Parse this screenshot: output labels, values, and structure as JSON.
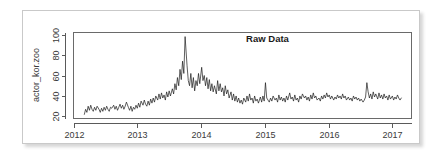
{
  "figure": {
    "frame_color": "#c9c9c9",
    "background": "#ffffff"
  },
  "chart_data": {
    "type": "line",
    "title": "Raw Data",
    "xlabel": "",
    "ylabel": "actor_kor.zoo",
    "xlim": [
      2012.0,
      2017.3
    ],
    "ylim": [
      18,
      102
    ],
    "grid": false,
    "legend": null,
    "x_tick_labels": [
      "2012",
      "2013",
      "2014",
      "2015",
      "2016",
      "2017"
    ],
    "x_tick_values": [
      2012,
      2013,
      2014,
      2015,
      2016,
      2017
    ],
    "y_tick_labels": [
      "20",
      "40",
      "60",
      "80",
      "100"
    ],
    "y_tick_values": [
      20,
      40,
      60,
      80,
      100
    ],
    "series_name": "actor_kor.zoo",
    "line_color": "#1a1a1a",
    "x": [
      2012.17,
      2012.19,
      2012.21,
      2012.23,
      2012.25,
      2012.27,
      2012.29,
      2012.31,
      2012.33,
      2012.35,
      2012.37,
      2012.4,
      2012.42,
      2012.44,
      2012.46,
      2012.48,
      2012.5,
      2012.52,
      2012.54,
      2012.56,
      2012.58,
      2012.6,
      2012.63,
      2012.65,
      2012.67,
      2012.69,
      2012.71,
      2012.73,
      2012.75,
      2012.77,
      2012.79,
      2012.81,
      2012.83,
      2012.86,
      2012.88,
      2012.9,
      2012.92,
      2012.94,
      2012.96,
      2012.98,
      2013.0,
      2013.02,
      2013.04,
      2013.06,
      2013.09,
      2013.11,
      2013.13,
      2013.15,
      2013.17,
      2013.19,
      2013.21,
      2013.23,
      2013.25,
      2013.27,
      2013.29,
      2013.32,
      2013.34,
      2013.36,
      2013.38,
      2013.4,
      2013.42,
      2013.44,
      2013.46,
      2013.48,
      2013.5,
      2013.52,
      2013.55,
      2013.57,
      2013.59,
      2013.61,
      2013.63,
      2013.65,
      2013.67,
      2013.69,
      2013.71,
      2013.73,
      2013.75,
      2013.78,
      2013.8,
      2013.82,
      2013.84,
      2013.86,
      2013.88,
      2013.9,
      2013.92,
      2013.94,
      2013.96,
      2013.98,
      2014.01,
      2014.03,
      2014.05,
      2014.07,
      2014.09,
      2014.11,
      2014.13,
      2014.15,
      2014.17,
      2014.19,
      2014.21,
      2014.24,
      2014.26,
      2014.28,
      2014.3,
      2014.32,
      2014.34,
      2014.36,
      2014.38,
      2014.4,
      2014.42,
      2014.44,
      2014.47,
      2014.49,
      2014.51,
      2014.53,
      2014.55,
      2014.57,
      2014.59,
      2014.61,
      2014.63,
      2014.65,
      2014.67,
      2014.7,
      2014.72,
      2014.74,
      2014.76,
      2014.78,
      2014.8,
      2014.82,
      2014.84,
      2014.86,
      2014.88,
      2014.9,
      2014.93,
      2014.95,
      2014.97,
      2014.99,
      2015.01,
      2015.03,
      2015.05,
      2015.07,
      2015.09,
      2015.11,
      2015.13,
      2015.16,
      2015.18,
      2015.2,
      2015.22,
      2015.24,
      2015.26,
      2015.28,
      2015.3,
      2015.32,
      2015.34,
      2015.36,
      2015.39,
      2015.41,
      2015.43,
      2015.45,
      2015.47,
      2015.49,
      2015.51,
      2015.53,
      2015.55,
      2015.57,
      2015.59,
      2015.62,
      2015.64,
      2015.66,
      2015.68,
      2015.7,
      2015.72,
      2015.74,
      2015.76,
      2015.78,
      2015.8,
      2015.82,
      2015.85,
      2015.87,
      2015.89,
      2015.91,
      2015.93,
      2015.95,
      2015.97,
      2015.99,
      2016.01,
      2016.03,
      2016.05,
      2016.08,
      2016.1,
      2016.12,
      2016.14,
      2016.16,
      2016.18,
      2016.2,
      2016.22,
      2016.24,
      2016.26,
      2016.28,
      2016.31,
      2016.33,
      2016.35,
      2016.37,
      2016.39,
      2016.41,
      2016.43,
      2016.45,
      2016.47,
      2016.49,
      2016.51,
      2016.54,
      2016.56,
      2016.58,
      2016.6,
      2016.62,
      2016.64,
      2016.66,
      2016.68,
      2016.7,
      2016.72,
      2016.74,
      2016.77,
      2016.79,
      2016.81,
      2016.83,
      2016.85,
      2016.87,
      2016.89,
      2016.91,
      2016.93,
      2016.95,
      2016.97,
      2017.0,
      2017.02,
      2017.04,
      2017.06,
      2017.08,
      2017.1,
      2017.12,
      2017.14
    ],
    "values": [
      22,
      27,
      24,
      30,
      26,
      31,
      27,
      25,
      29,
      26,
      30,
      27,
      24,
      28,
      25,
      29,
      26,
      30,
      27,
      25,
      29,
      28,
      31,
      27,
      30,
      26,
      29,
      32,
      28,
      31,
      27,
      30,
      34,
      29,
      26,
      30,
      25,
      29,
      27,
      31,
      28,
      33,
      29,
      35,
      31,
      36,
      32,
      30,
      35,
      31,
      37,
      33,
      38,
      34,
      40,
      36,
      42,
      37,
      43,
      38,
      41,
      36,
      44,
      39,
      45,
      40,
      47,
      42,
      52,
      46,
      58,
      50,
      66,
      56,
      74,
      62,
      98,
      70,
      55,
      50,
      62,
      48,
      58,
      45,
      55,
      50,
      62,
      52,
      68,
      55,
      60,
      50,
      58,
      47,
      56,
      45,
      52,
      44,
      50,
      42,
      55,
      45,
      52,
      44,
      48,
      40,
      50,
      42,
      46,
      38,
      44,
      36,
      42,
      35,
      40,
      34,
      38,
      33,
      36,
      32,
      38,
      34,
      40,
      35,
      42,
      36,
      38,
      33,
      40,
      35,
      37,
      33,
      39,
      34,
      40,
      35,
      53,
      38,
      36,
      34,
      38,
      35,
      40,
      36,
      38,
      34,
      41,
      36,
      39,
      35,
      38,
      34,
      40,
      36,
      43,
      37,
      39,
      35,
      41,
      36,
      38,
      34,
      40,
      37,
      42,
      38,
      40,
      36,
      39,
      35,
      41,
      37,
      43,
      38,
      40,
      36,
      38,
      35,
      40,
      37,
      41,
      38,
      43,
      39,
      41,
      37,
      40,
      36,
      39,
      37,
      41,
      38,
      40,
      37,
      42,
      38,
      40,
      36,
      39,
      36,
      38,
      35,
      40,
      37,
      39,
      36,
      38,
      35,
      37,
      34,
      36,
      39,
      53,
      44,
      38,
      42,
      37,
      44,
      39,
      42,
      37,
      43,
      38,
      41,
      37,
      42,
      38,
      40,
      36,
      41,
      37,
      40,
      36,
      39,
      37,
      41,
      38,
      36,
      38
    ]
  }
}
